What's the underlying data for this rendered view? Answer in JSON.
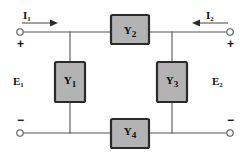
{
  "diagram": {
    "type": "electrical-circuit-schematic",
    "background_color": "#ffffff",
    "wire_color": "#555555",
    "block_fill_color": "#b3b3b3",
    "block_border_color": "#2b2b2b",
    "text_color": "#111111"
  },
  "blocks": [
    {
      "id": "y1",
      "label": "Y",
      "subscript": "1",
      "orientation": "vertical",
      "x": 70,
      "y": 82
    },
    {
      "id": "y2",
      "label": "Y",
      "subscript": "2",
      "orientation": "horizontal",
      "x": 130,
      "y": 32
    },
    {
      "id": "y3",
      "label": "Y",
      "subscript": "3",
      "orientation": "vertical",
      "x": 172,
      "y": 82
    },
    {
      "id": "y4",
      "label": "Y",
      "subscript": "4",
      "orientation": "horizontal",
      "x": 130,
      "y": 133
    }
  ],
  "currents": [
    {
      "id": "i1",
      "label": "I",
      "subscript": "1",
      "direction": "right",
      "port": "left"
    },
    {
      "id": "i2",
      "label": "I",
      "subscript": "2",
      "direction": "left",
      "port": "right"
    }
  ],
  "voltages": [
    {
      "id": "e1",
      "label": "E",
      "subscript": "1",
      "port": "left"
    },
    {
      "id": "e2",
      "label": "E",
      "subscript": "2",
      "port": "right"
    }
  ],
  "polarity_signs": {
    "top_left": "+",
    "top_right": "+",
    "bottom_left": "−",
    "bottom_right": "−"
  },
  "terminals": [
    {
      "id": "t-top-left",
      "x": 20,
      "y": 32
    },
    {
      "id": "t-top-right",
      "x": 230,
      "y": 32
    },
    {
      "id": "t-bottom-left",
      "x": 20,
      "y": 133
    },
    {
      "id": "t-bottom-right",
      "x": 230,
      "y": 133
    }
  ]
}
